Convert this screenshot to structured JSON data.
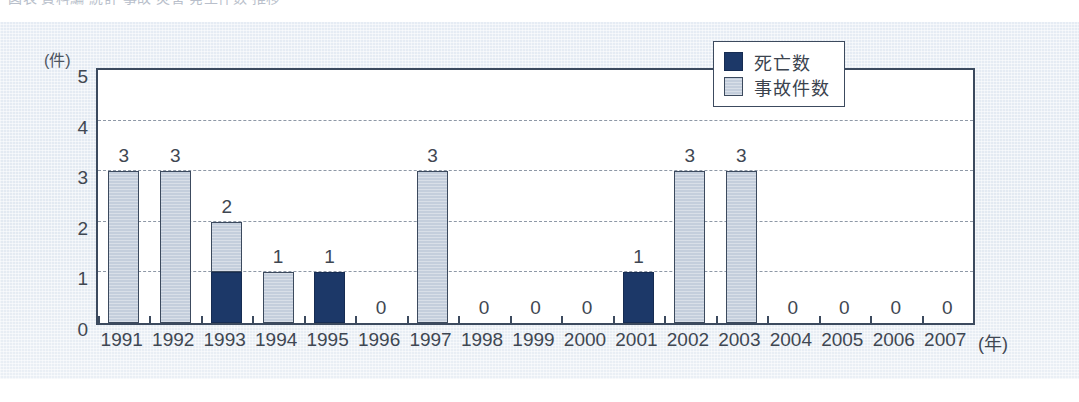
{
  "title_strip": {
    "ghost_text": "図表  資料編  統計  事故  災害  発生件数  推移"
  },
  "legend": {
    "position": "inside-top-right",
    "entries": [
      {
        "label": "死亡数",
        "color": "#1c3868",
        "icon": "legend-swatch-dark"
      },
      {
        "label": "事故件数",
        "color": "#c4cedc",
        "icon": "legend-swatch-light"
      }
    ]
  },
  "axes": {
    "y_unit": "(件)",
    "y_ticks": [
      "0",
      "1",
      "2",
      "3",
      "4",
      "5"
    ],
    "x_unit": "(年)"
  },
  "colors": {
    "deaths": "#1c3868",
    "accidents": "#c4cedc",
    "frame": "#3c4a5e",
    "grid": "#8e98a6",
    "paper": "#e4ebf3",
    "plot_bg": "#ffffff",
    "text": "#3f4752"
  },
  "chart_data": {
    "type": "bar",
    "title": "",
    "subtitle": "",
    "xlabel": "(年)",
    "ylabel": "(件)",
    "ylim": [
      0,
      5
    ],
    "ytick_step": 1,
    "grid": true,
    "grid_style": "dashed-horizontal",
    "stacked": true,
    "legend_position": "top-right-inside",
    "categories": [
      "1991",
      "1992",
      "1993",
      "1994",
      "1995",
      "1996",
      "1997",
      "1998",
      "1999",
      "2000",
      "2001",
      "2002",
      "2003",
      "2004",
      "2005",
      "2006",
      "2007"
    ],
    "series": [
      {
        "name": "死亡数",
        "color": "#1c3868",
        "values": [
          0,
          0,
          1,
          0,
          1,
          0,
          0,
          0,
          0,
          0,
          1,
          0,
          0,
          0,
          0,
          0,
          0
        ]
      },
      {
        "name": "事故件数",
        "color": "#c4cedc",
        "values": [
          3,
          3,
          1,
          1,
          0,
          0,
          3,
          0,
          0,
          0,
          0,
          3,
          3,
          0,
          0,
          0,
          0
        ]
      }
    ],
    "totals": [
      3,
      3,
      2,
      1,
      1,
      0,
      3,
      0,
      0,
      0,
      1,
      3,
      3,
      0,
      0,
      0,
      0
    ],
    "data_labels": [
      "3",
      "3",
      "2",
      "1",
      "1",
      "0",
      "3",
      "0",
      "0",
      "0",
      "1",
      "3",
      "3",
      "0",
      "0",
      "0",
      "0"
    ]
  }
}
